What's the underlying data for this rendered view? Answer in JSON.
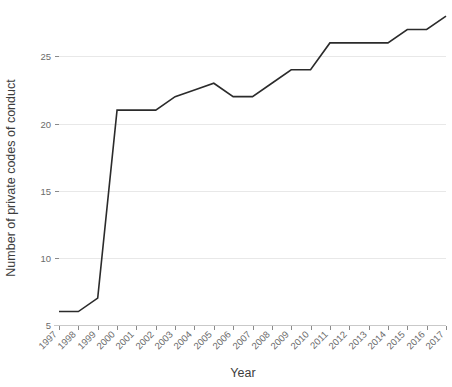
{
  "chart_data": {
    "type": "line",
    "title": "",
    "xlabel": "Year",
    "ylabel": "Number of private codes of conduct",
    "categories": [
      "1997",
      "1998",
      "1999",
      "2000",
      "2001",
      "2002",
      "2003",
      "2004",
      "2005",
      "2006",
      "2007",
      "2008",
      "2009",
      "2010",
      "2011",
      "2012",
      "2013",
      "2014",
      "2015",
      "2016",
      "2017"
    ],
    "values": [
      6,
      6,
      7,
      21,
      21,
      21,
      22,
      22.5,
      23,
      22,
      22,
      23,
      24,
      24,
      26,
      26,
      26,
      26,
      27,
      27,
      28
    ],
    "x": [
      1997,
      1998,
      1999,
      2000,
      2001,
      2002,
      2003,
      2004,
      2005,
      2006,
      2007,
      2008,
      2009,
      2010,
      2011,
      2012,
      2013,
      2014,
      2015,
      2016,
      2017
    ],
    "ytick_labels": [
      "5",
      "10",
      "15",
      "20",
      "25"
    ],
    "ytick_values": [
      5,
      10,
      15,
      20,
      25
    ],
    "ylim": [
      5,
      28.6
    ],
    "xlim": [
      1997,
      2017
    ],
    "grid": "horizontal",
    "legend": "none",
    "series": [
      {
        "name": "Number of private codes of conduct",
        "values": [
          6,
          6,
          7,
          21,
          21,
          21,
          22,
          22.5,
          23,
          22,
          22,
          23,
          24,
          24,
          26,
          26,
          26,
          26,
          27,
          27,
          28
        ]
      }
    ],
    "line_color": "#2b2b2b",
    "grid_color": "#e8e8e8"
  }
}
